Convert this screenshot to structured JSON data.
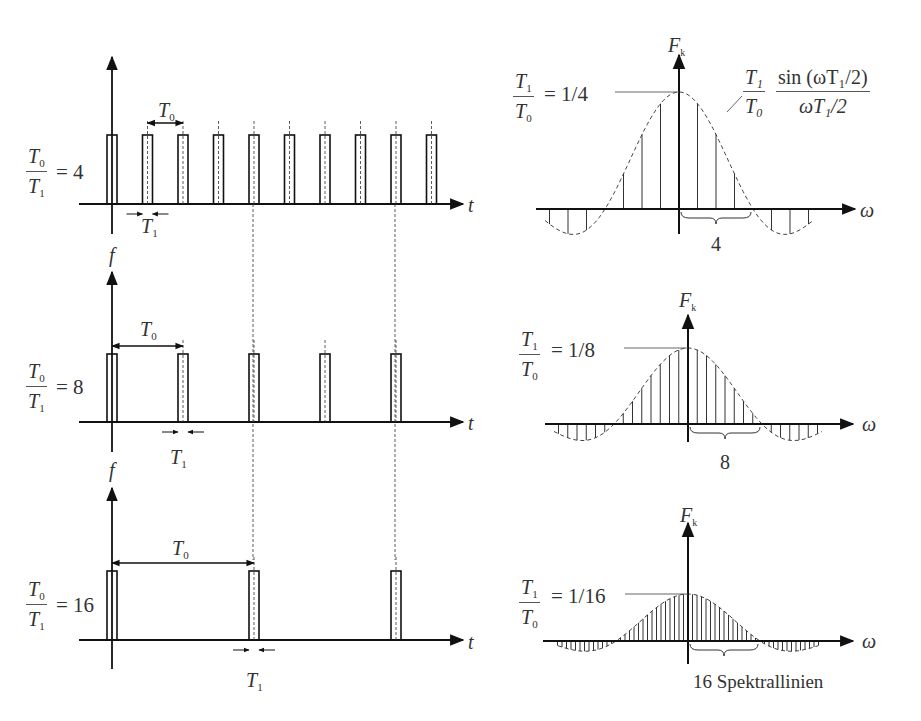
{
  "figure": {
    "axis_labels": {
      "time": "t",
      "signal": "f",
      "spectrum": "F",
      "spectrum_sub": "k",
      "omega": "ω"
    },
    "rows": [
      {
        "ratio_label": {
          "num": "T",
          "num_sub": "0",
          "den": "T",
          "den_sub": "1",
          "value": "= 4"
        },
        "period_label": {
          "sym": "T",
          "sub": "0"
        },
        "width_label": {
          "sym": "T",
          "sub": "1"
        },
        "pulse_count": 10,
        "spectrum": {
          "peak_label": {
            "num": "T",
            "num_sub": "1",
            "den": "T",
            "den_sub": "0",
            "value": "= 1/4"
          },
          "brace_label": "4",
          "lines_per_lobe": 4,
          "envelope_formula": {
            "coef_num": "T₁",
            "coef_den": "T₀",
            "num": "sin (ωT₁/2)",
            "den": "ωT₁/2"
          }
        }
      },
      {
        "ratio_label": {
          "num": "T",
          "num_sub": "0",
          "den": "T",
          "den_sub": "1",
          "value": "= 8"
        },
        "period_label": {
          "sym": "T",
          "sub": "0"
        },
        "width_label": {
          "sym": "T",
          "sub": "1"
        },
        "pulse_count": 5,
        "spectrum": {
          "peak_label": {
            "num": "T",
            "num_sub": "1",
            "den": "T",
            "den_sub": "0",
            "value": "= 1/8"
          },
          "brace_label": "8",
          "lines_per_lobe": 8
        }
      },
      {
        "ratio_label": {
          "num": "T",
          "num_sub": "0",
          "den": "T",
          "den_sub": "1",
          "value": "= 16"
        },
        "period_label": {
          "sym": "T",
          "sub": "0"
        },
        "width_label": {
          "sym": "T",
          "sub": "1"
        },
        "pulse_count": 3,
        "spectrum": {
          "peak_label": {
            "num": "T",
            "num_sub": "1",
            "den": "T",
            "den_sub": "0",
            "value": "= 1/16"
          },
          "brace_label": "16 Spektrallinien",
          "lines_per_lobe": 16
        }
      }
    ]
  }
}
